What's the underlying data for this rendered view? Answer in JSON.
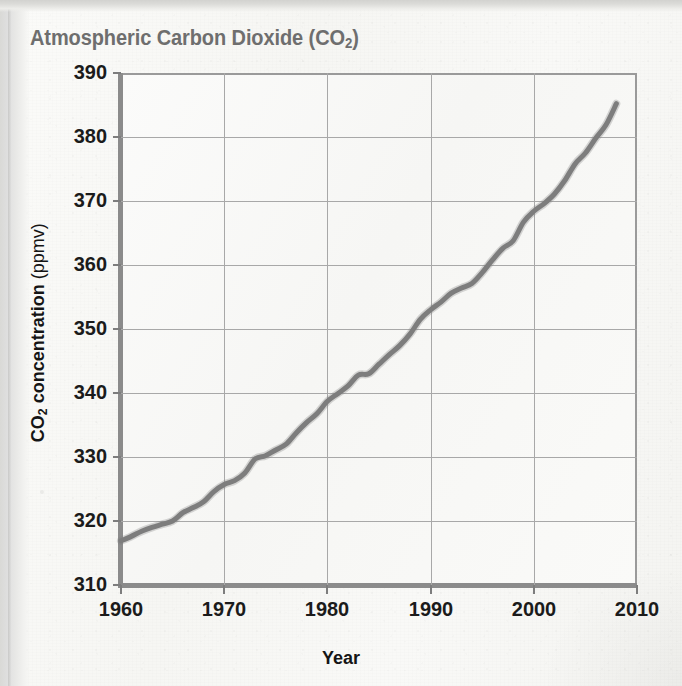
{
  "chart_data": {
    "type": "line",
    "title": "Atmospheric Carbon Dioxide (CO2)",
    "title_main": "Atmospheric Carbon Dioxide (CO",
    "title_sub": "2",
    "title_tail": ")",
    "xlabel": "Year",
    "ylabel": "CO2 concentration (ppmv)",
    "ylabel_main": "CO",
    "ylabel_sub": "2",
    "ylabel_rest": " concentration ",
    "ylabel_unit": "(ppmv)",
    "xlim": [
      1960,
      2010
    ],
    "ylim": [
      310,
      390
    ],
    "xticks": [
      1960,
      1970,
      1980,
      1990,
      2000,
      2010
    ],
    "yticks": [
      310,
      320,
      330,
      340,
      350,
      360,
      370,
      380,
      390
    ],
    "grid": true,
    "legend": null,
    "line_color": "#7d7d7d",
    "grid_color": "#a8a8a8",
    "frame_color": "#8b8b8b",
    "title_color": "#6e6e6e",
    "series": [
      {
        "name": "CO2 concentration",
        "x": [
          1960,
          1961,
          1962,
          1963,
          1964,
          1965,
          1966,
          1967,
          1968,
          1969,
          1970,
          1971,
          1972,
          1973,
          1974,
          1975,
          1976,
          1977,
          1978,
          1979,
          1980,
          1981,
          1982,
          1983,
          1984,
          1985,
          1986,
          1987,
          1988,
          1989,
          1990,
          1991,
          1992,
          1993,
          1994,
          1995,
          1996,
          1997,
          1998,
          1999,
          2000,
          2001,
          2002,
          2003,
          2004,
          2005,
          2006,
          2007,
          2008
        ],
        "values": [
          316.9,
          317.6,
          318.4,
          319.0,
          319.5,
          320.0,
          321.3,
          322.1,
          323.0,
          324.6,
          325.7,
          326.3,
          327.5,
          329.7,
          330.2,
          331.1,
          332.0,
          333.8,
          335.4,
          336.8,
          338.7,
          339.9,
          341.1,
          342.8,
          343.0,
          344.5,
          346.0,
          347.4,
          349.2,
          351.5,
          353.0,
          354.2,
          355.6,
          356.4,
          357.1,
          358.8,
          360.8,
          362.6,
          363.8,
          366.7,
          368.4,
          369.6,
          371.1,
          373.2,
          375.8,
          377.5,
          379.8,
          381.9,
          385.2
        ]
      }
    ]
  },
  "page": {
    "title_color": "#6e6e6e"
  }
}
